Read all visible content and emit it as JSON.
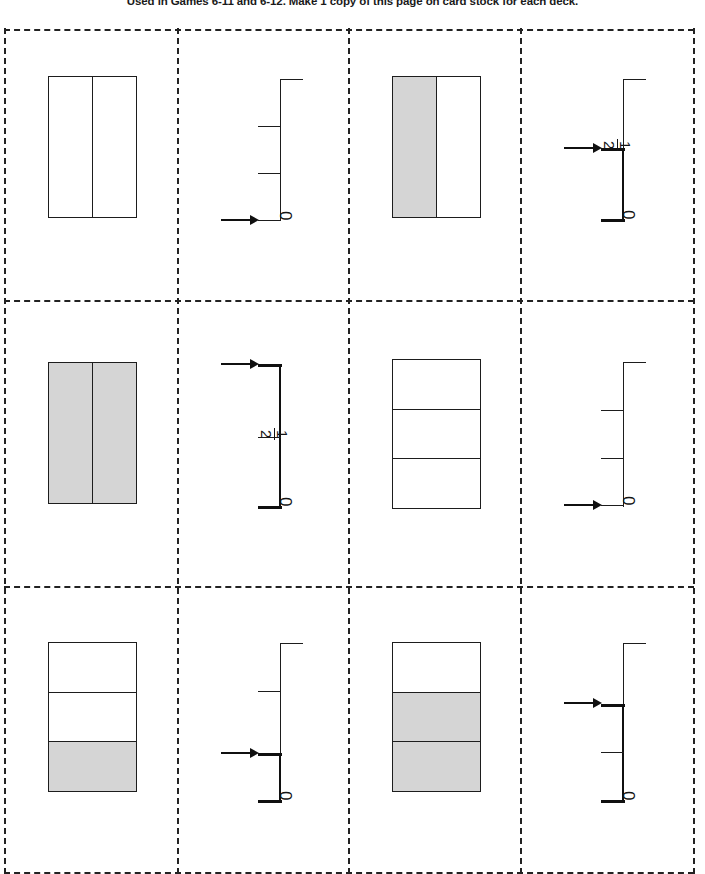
{
  "header": {
    "note": "Used in Games 6-11 and 6-12. Make 1 copy of this page on card stock for each deck."
  },
  "grid": {
    "columns": 4,
    "rows": 3,
    "style": "dashed-cut-lines"
  },
  "cards": [
    {
      "id": "card-1",
      "type": "area-model",
      "orientation": "vertical-split",
      "total_parts": 2,
      "shaded_parts": 0,
      "fraction": "0/2",
      "parts": [
        false,
        false
      ]
    },
    {
      "id": "card-2",
      "type": "number-line",
      "ticks": 4,
      "arrow_at_tick": 0,
      "value": "0",
      "labels": [
        {
          "tick": 0,
          "text": "0"
        }
      ],
      "bold_from": 0,
      "bold_to": 0
    },
    {
      "id": "card-3",
      "type": "area-model",
      "orientation": "vertical-split",
      "total_parts": 2,
      "shaded_parts": 1,
      "fraction": "1/2",
      "parts": [
        true,
        false
      ]
    },
    {
      "id": "card-4",
      "type": "number-line",
      "ticks": 3,
      "arrow_at_tick": 1,
      "value": "1/2",
      "labels": [
        {
          "tick": 0,
          "text": "0"
        },
        {
          "tick": 1,
          "text": "1/2",
          "numerator": "1",
          "denominator": "2"
        }
      ],
      "bold_from": 0,
      "bold_to": 1
    },
    {
      "id": "card-5",
      "type": "area-model",
      "orientation": "vertical-split",
      "total_parts": 2,
      "shaded_parts": 2,
      "fraction": "2/2",
      "parts": [
        true,
        true
      ]
    },
    {
      "id": "card-6",
      "type": "number-line",
      "ticks": 3,
      "arrow_at_tick": 2,
      "value": "1",
      "labels": [
        {
          "tick": 0,
          "text": "0"
        },
        {
          "tick": 1,
          "text": "1/2",
          "numerator": "1",
          "denominator": "2"
        }
      ],
      "bold_from": 0,
      "bold_to": 2
    },
    {
      "id": "card-7",
      "type": "area-model",
      "orientation": "horizontal-split",
      "total_parts": 3,
      "shaded_parts": 0,
      "fraction": "0/3",
      "parts": [
        false,
        false,
        false
      ]
    },
    {
      "id": "card-8",
      "type": "number-line",
      "ticks": 4,
      "arrow_at_tick": 0,
      "value": "0",
      "labels": [
        {
          "tick": 0,
          "text": "0"
        }
      ],
      "bold_from": 0,
      "bold_to": 0
    },
    {
      "id": "card-9",
      "type": "area-model",
      "orientation": "horizontal-split",
      "total_parts": 3,
      "shaded_parts": 1,
      "fraction": "1/3",
      "parts": [
        false,
        false,
        true
      ]
    },
    {
      "id": "card-10",
      "type": "number-line",
      "ticks": 4,
      "arrow_at_tick": 1,
      "value": "1/3",
      "labels": [
        {
          "tick": 0,
          "text": "0"
        }
      ],
      "bold_from": 0,
      "bold_to": 1
    },
    {
      "id": "card-11",
      "type": "area-model",
      "orientation": "horizontal-split",
      "total_parts": 3,
      "shaded_parts": 2,
      "fraction": "2/3",
      "parts": [
        false,
        true,
        true
      ]
    },
    {
      "id": "card-12",
      "type": "number-line",
      "ticks": 4,
      "arrow_at_tick": 2,
      "value": "2/3",
      "labels": [
        {
          "tick": 0,
          "text": "0"
        }
      ],
      "bold_from": 0,
      "bold_to": 2
    }
  ],
  "colors": {
    "shading": "#d5d5d5",
    "ink": "#1d1d1d",
    "bold_ink": "#101010",
    "background": "#ffffff"
  }
}
